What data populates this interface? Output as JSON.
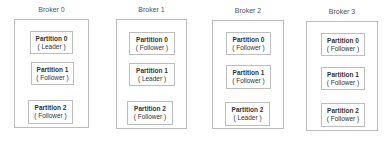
{
  "brokers": [
    {
      "label": "Broker 0",
      "partitions": [
        {
          "name": "Partition 0",
          "role": "( Leader )"
        },
        {
          "name": "Partition 1",
          "role": "( Follower )"
        },
        {
          "name": "Partition 2",
          "role": "( Follower )"
        }
      ]
    },
    {
      "label": "Broker 1",
      "partitions": [
        {
          "name": "Partition 0",
          "role": "( Follower )"
        },
        {
          "name": "Partition 1",
          "role": "( Leader )"
        },
        {
          "name": "Partition 2",
          "role": "( Follower )"
        }
      ]
    },
    {
      "label": "Broker 2",
      "partitions": [
        {
          "name": "Partition 0",
          "role": "( Follower )"
        },
        {
          "name": "Partition 1",
          "role": "( Follower )"
        },
        {
          "name": "Partition 2",
          "role": "( Leader )"
        }
      ]
    },
    {
      "label": "Broker 3",
      "partitions": [
        {
          "name": "Partition 0",
          "role": "( Follower )"
        },
        {
          "name": "Partition 1",
          "role": "( Follower )"
        },
        {
          "name": "Partition 2",
          "role": "( Follower )"
        }
      ]
    }
  ]
}
